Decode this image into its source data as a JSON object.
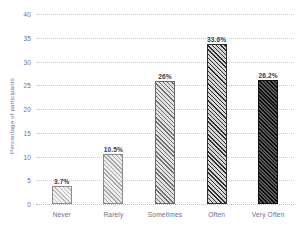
{
  "chart_data": {
    "type": "bar",
    "title": "",
    "xlabel": "",
    "ylabel": "Percentage of participants",
    "categories": [
      "Never",
      "Rarely",
      "Sometimes",
      "Often",
      "Very Often"
    ],
    "values": [
      3.7,
      10.5,
      26,
      33.6,
      26.2
    ],
    "data_labels": [
      "3.7%",
      "10.5%",
      "26%",
      "33.6%",
      "26.2%"
    ],
    "ylim": [
      0,
      40
    ],
    "yticks": [
      0,
      5,
      10,
      15,
      20,
      25,
      30,
      35,
      40
    ],
    "ytick_labels": [
      "0",
      "5",
      "10",
      "15",
      "20",
      "25",
      "30",
      "35",
      "40"
    ],
    "grid": true,
    "grid_style": "dotted-horizontal",
    "legend": false,
    "legend_position": "none",
    "bar_fills": [
      "diagonal-hatch-lightest",
      "diagonal-hatch-light",
      "diagonal-hatch-medium",
      "diagonal-hatch-dark",
      "diagonal-hatch-darkest"
    ],
    "colors": {
      "axis_text": "#6e6d92",
      "ylabel_text": "#6e6d92",
      "data_label_text": "#3b3b46",
      "gridline": "#c9c8da",
      "background": "#ffffff"
    }
  }
}
